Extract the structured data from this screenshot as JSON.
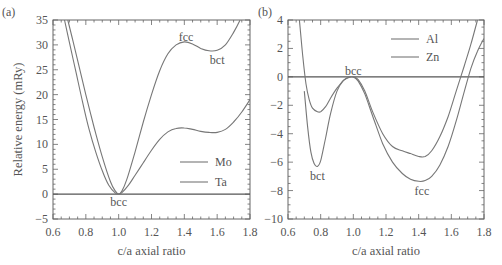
{
  "chart_data": [
    {
      "panel": "(a)",
      "type": "line",
      "title": "",
      "xlabel": "c/a axial ratio",
      "ylabel": "Relative energy (mRy)",
      "xlim": [
        0.6,
        1.8
      ],
      "ylim": [
        -5,
        35
      ],
      "xticks": [
        "0.6",
        "0.8",
        "1.0",
        "1.2",
        "1.4",
        "1.6",
        "1.8"
      ],
      "yticks": [
        "35",
        "30",
        "25",
        "20",
        "15",
        "10",
        "5",
        "0",
        "-5"
      ],
      "legend": {
        "position": "lower right",
        "entries": [
          "Mo",
          "Ta"
        ]
      },
      "annotations": [
        {
          "text": "fcc",
          "x": 1.41,
          "y": 31.5
        },
        {
          "text": "bct",
          "x": 1.6,
          "y": 27
        },
        {
          "text": "bcc",
          "x": 1.0,
          "y": -1.5
        }
      ],
      "series": [
        {
          "name": "Mo",
          "x": [
            0.69,
            0.72,
            0.76,
            0.8,
            0.85,
            0.9,
            0.95,
            0.98,
            1.0,
            1.02,
            1.05,
            1.1,
            1.15,
            1.2,
            1.25,
            1.3,
            1.35,
            1.4,
            1.45,
            1.5,
            1.55,
            1.6,
            1.65,
            1.7,
            1.74
          ],
          "values": [
            35,
            31,
            25.5,
            20,
            13.5,
            7.5,
            2.5,
            0.6,
            0,
            0.6,
            3,
            8.5,
            14.5,
            20,
            24.8,
            28.2,
            30,
            30.6,
            30.2,
            29.3,
            28.8,
            28.9,
            30,
            32.5,
            35
          ]
        },
        {
          "name": "Ta",
          "x": [
            0.67,
            0.7,
            0.74,
            0.78,
            0.82,
            0.86,
            0.9,
            0.94,
            0.98,
            1.0,
            1.02,
            1.06,
            1.1,
            1.15,
            1.2,
            1.25,
            1.3,
            1.35,
            1.4,
            1.45,
            1.5,
            1.55,
            1.6,
            1.65,
            1.7,
            1.75,
            1.8
          ],
          "values": [
            35,
            30.5,
            24.5,
            18.5,
            13,
            8.5,
            4.7,
            1.8,
            0.2,
            0,
            0.3,
            1.8,
            3.8,
            6.3,
            8.8,
            11,
            12.5,
            13.2,
            13.3,
            13,
            12.6,
            12.4,
            12.4,
            13,
            14.5,
            16.5,
            19
          ]
        }
      ]
    },
    {
      "panel": "(b)",
      "type": "line",
      "title": "",
      "xlabel": "c/a axial ratio",
      "ylabel": "",
      "xlim": [
        0.6,
        1.8
      ],
      "ylim": [
        -10,
        4
      ],
      "xticks": [
        "0.6",
        "0.8",
        "1.0",
        "1.2",
        "1.4",
        "1.6",
        "1.8"
      ],
      "yticks": [
        "4",
        "2",
        "0",
        "-2",
        "-4",
        "-6",
        "-8",
        "-10"
      ],
      "legend": {
        "position": "upper right",
        "entries": [
          "Al",
          "Zn"
        ]
      },
      "annotations": [
        {
          "text": "bcc",
          "x": 1.0,
          "y": 0.4
        },
        {
          "text": "bct",
          "x": 0.78,
          "y": -7
        },
        {
          "text": "fcc",
          "x": 1.42,
          "y": -8
        }
      ],
      "series": [
        {
          "name": "Al",
          "x": [
            0.67,
            0.69,
            0.71,
            0.73,
            0.75,
            0.78,
            0.8,
            0.83,
            0.86,
            0.9,
            0.94,
            0.98,
            1.0,
            1.03,
            1.07,
            1.12,
            1.18,
            1.24,
            1.3,
            1.35,
            1.4,
            1.44,
            1.48,
            1.53,
            1.58,
            1.63,
            1.68,
            1.72,
            1.76
          ],
          "values": [
            4,
            1.5,
            -0.5,
            -1.6,
            -2.2,
            -2.45,
            -2.45,
            -2.1,
            -1.5,
            -0.8,
            -0.25,
            0,
            0,
            -0.2,
            -1,
            -2.5,
            -4,
            -4.9,
            -5.2,
            -5.4,
            -5.6,
            -5.6,
            -5.2,
            -4.2,
            -2.8,
            -1.0,
            0.8,
            2.3,
            4
          ]
        },
        {
          "name": "Zn",
          "x": [
            0.7,
            0.72,
            0.74,
            0.76,
            0.78,
            0.8,
            0.83,
            0.86,
            0.9,
            0.94,
            0.98,
            1.0,
            1.03,
            1.07,
            1.12,
            1.18,
            1.24,
            1.3,
            1.35,
            1.4,
            1.44,
            1.48,
            1.53,
            1.58,
            1.63,
            1.68,
            1.72,
            1.76,
            1.8
          ],
          "values": [
            -1,
            -3.5,
            -5.3,
            -6.1,
            -6.3,
            -5.9,
            -4.3,
            -2.6,
            -1.0,
            -0.25,
            0,
            0,
            -0.3,
            -1.2,
            -2.8,
            -4.7,
            -6.0,
            -6.8,
            -7.2,
            -7.35,
            -7.3,
            -7.0,
            -6.2,
            -4.9,
            -3.1,
            -1.0,
            0.6,
            1.8,
            2.7
          ]
        }
      ]
    }
  ],
  "panels": {
    "a": {
      "label": "(a)",
      "ylabel": "Relative energy (mRy)",
      "xlabel": "c/a axial ratio",
      "legend": [
        "Mo",
        "Ta"
      ],
      "annotations": {
        "fcc": "fcc",
        "bct": "bct",
        "bcc": "bcc"
      }
    },
    "b": {
      "label": "(b)",
      "xlabel": "c/a axial ratio",
      "legend": [
        "Al",
        "Zn"
      ],
      "annotations": {
        "fcc": "fcc",
        "bct": "bct",
        "bcc": "bcc"
      }
    }
  },
  "colors": {
    "curve": "#777777",
    "axis": "#666666",
    "text": "#555555",
    "background": "#ffffff"
  }
}
